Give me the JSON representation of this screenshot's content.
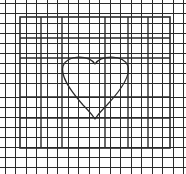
{
  "figure": {
    "width": 186,
    "height": 174,
    "background": "#ffffff",
    "line_color": "#2a2a2a",
    "thin_grid": {
      "vertical_x": [
        5,
        15,
        26,
        36,
        47,
        57,
        68,
        78,
        89,
        99,
        110,
        120,
        131,
        141,
        152,
        162,
        173,
        183
      ],
      "horizontal_y": [
        3,
        13,
        23,
        33,
        43,
        53,
        63,
        73,
        83,
        97,
        107,
        117,
        127,
        137,
        147,
        157,
        167
      ],
      "stroke_width": 1
    },
    "inner_rect": {
      "x": 20,
      "y": 17,
      "width": 150,
      "height": 131,
      "stroke_width": 1.6
    },
    "thick_lines": {
      "vertical_x": [
        41,
        62,
        105,
        128,
        148
      ],
      "horizontal_y": [
        38,
        58,
        97,
        118
      ],
      "x_range": [
        20,
        170
      ],
      "y_range": [
        17,
        148
      ],
      "stroke_width": 1.4
    },
    "heart": {
      "center_x": 95,
      "notch_y": 64,
      "top_y": 58,
      "left_x": 62,
      "right_x": 129,
      "tip_y": 119,
      "stroke_width": 1.2
    }
  }
}
